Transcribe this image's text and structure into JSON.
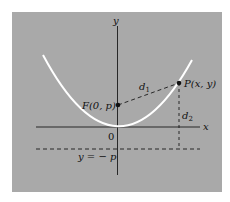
{
  "figure": {
    "background_color": "#a9a9a9",
    "parabola_color": "#ffffff",
    "line_color": "#1a1a1a",
    "labels": {
      "y_axis": "y",
      "x_axis": "x",
      "origin": "0",
      "focus": "F(0, p)",
      "point": "P(x, y)",
      "d1": "d",
      "d1_sub": "1",
      "d2": "d",
      "d2_sub": "2",
      "directrix": "y = − p"
    }
  }
}
